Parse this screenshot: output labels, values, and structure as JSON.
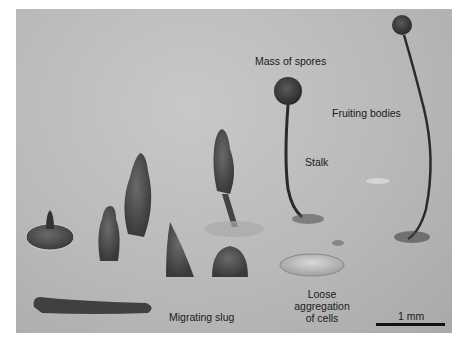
{
  "figure": {
    "labels": {
      "mass_of_spores": "Mass of spores",
      "fruiting_bodies": "Fruiting bodies",
      "stalk": "Stalk",
      "loose_aggregation": [
        "Loose",
        "aggregation",
        "of cells"
      ],
      "migrating_slug": "Migrating slug"
    },
    "scale_bar": {
      "label": "1 mm"
    },
    "colors": {
      "background": "#b9b9b9",
      "structure": "#4a4a4a",
      "text": "#1a1a1a"
    }
  }
}
